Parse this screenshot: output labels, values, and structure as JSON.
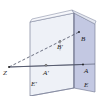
{
  "figure": {
    "type": "geometry-diagram",
    "background_color": "#ffffff",
    "colors": {
      "left_plane_fill": "#eef1f7",
      "right_plane_fill": "#c3c8e2",
      "top_plane_fill": "#f2f4f9",
      "edge_stroke": "#6a7088",
      "ray_stroke": "#4a4f63",
      "label_color": "#1a1a1a"
    },
    "labels": {
      "z": "Z",
      "a_prime": "A'",
      "a": "A",
      "b_prime": "B'",
      "b": "B",
      "e_prime": "E'",
      "e": "E"
    },
    "points": {
      "z": {
        "x": 9,
        "y": 67
      },
      "a_prime": {
        "x": 46,
        "y": 65
      },
      "a": {
        "x": 83,
        "y": 64
      },
      "b_prime": {
        "x": 60,
        "y": 40
      },
      "b": {
        "x": 79,
        "y": 32
      }
    },
    "lines": [
      {
        "name": "z-to-a",
        "from": "z",
        "to": "a",
        "style": "solid"
      },
      {
        "name": "z-to-b",
        "from": "z",
        "to": "b",
        "style": "dashed"
      }
    ]
  }
}
